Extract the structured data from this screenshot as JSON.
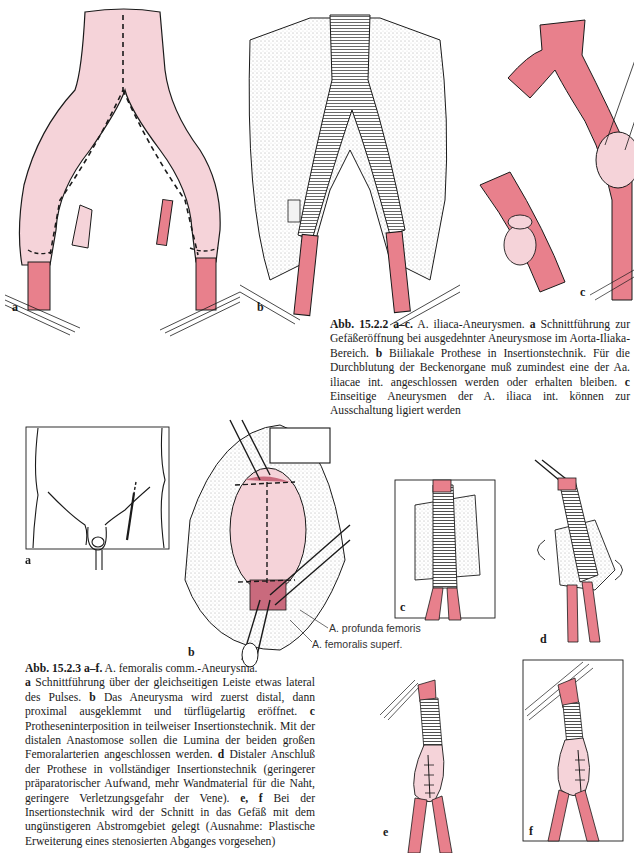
{
  "page": {
    "colors": {
      "vessel": "#e8808c",
      "aneurysm": "#f5d3d9",
      "ink": "#1a1a1a",
      "paper": "#ffffff"
    }
  },
  "figure_15_2_2": {
    "sublabels": [
      "a",
      "b",
      "c"
    ],
    "caption": {
      "id": "Abb. 15.2.2 a–c.",
      "title": "A. iliaca-Aneurysmen.",
      "parts": [
        {
          "label": "a",
          "text": "Schnittführung zur Gefäßeröffnung bei ausgedehnter Aneurysmose im Aorta-Iliaka-Bereich."
        },
        {
          "label": "b",
          "text": "Biiliakale Prothese in Insertionstechnik. Für die Durchblutung der Beckenorgane muß zumindest eine der Aa. iliacae int. angeschlossen werden oder erhalten bleiben."
        },
        {
          "label": "c",
          "text": "Einseitige Aneurysmen der A. iliaca int. können zur Ausschaltung ligiert werden"
        }
      ]
    }
  },
  "figure_15_2_3": {
    "sublabels": [
      "a",
      "b",
      "c",
      "d",
      "e",
      "f"
    ],
    "annotations": [
      "A. profunda femoris",
      "A. femoralis superf."
    ],
    "caption": {
      "id": "Abb. 15.2.3 a–f.",
      "title": "A. femoralis comm.-Aneurysma.",
      "parts": [
        {
          "label": "a",
          "text": "Schnittführung über der gleichseitigen Leiste etwas lateral des Pulses."
        },
        {
          "label": "b",
          "text": "Das Aneurysma wird zuerst distal, dann proximal ausgeklemmt und türflügelartig eröffnet."
        },
        {
          "label": "c",
          "text": "Protheseninterposition in teilweiser Insertionstechnik. Mit der distalen Anastomose sollen die Lumina der beiden großen Femoralarterien angeschlossen werden."
        },
        {
          "label": "d",
          "text": "Distaler Anschluß der Prothese in vollständiger Insertionstechnik (geringerer präparatorischer Aufwand, mehr Wandmaterial für die Naht, geringere Verletzungsgefahr der Vene)."
        },
        {
          "label": "e, f",
          "text": "Bei der Insertionstechnik wird der Schnitt in das Gefäß mit dem ungünstigeren Abstromgebiet gelegt (Ausnahme: Plastische Erweiterung eines stenosierten Abganges vorgesehen)"
        }
      ]
    }
  }
}
